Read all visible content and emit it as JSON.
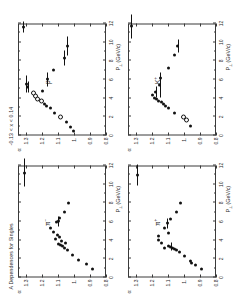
{
  "figure": {
    "title": "A Dependences for Singles",
    "kinematic_cut": "-0.13 < x  < 0.14",
    "kinematic_cut_sub": "F"
  },
  "axes": {
    "xlabel": "P  (GeV/c)",
    "xlabel_sub": "⊥",
    "ylabel": "α",
    "xticks": [
      "0",
      "2",
      "4",
      "6",
      "8",
      "10",
      "12"
    ],
    "xtick_values": [
      0,
      2,
      4,
      6,
      8,
      10,
      12
    ],
    "yticks": [
      "0.8",
      "0.9",
      "1.",
      "1.1",
      "1.2",
      "1.3"
    ],
    "ytick_values": [
      0.8,
      0.9,
      1.0,
      1.1,
      1.2,
      1.3
    ],
    "xlim": [
      0,
      12
    ],
    "ylim": [
      0.8,
      1.35
    ]
  },
  "chart_data": {
    "type": "scatter",
    "title": "A Dependences for Singles",
    "xlabel": "P⊥ (GeV/c)",
    "ylabel": "α",
    "xlim": [
      0,
      12
    ],
    "ylim": [
      0.8,
      1.35
    ],
    "grid": false,
    "legend": "none",
    "annotations": [
      "-0.13 < xF < 0.14"
    ],
    "panels": [
      {
        "id": "pi-minus",
        "label": "π",
        "label_sup": "−",
        "position": "top-left",
        "points": [
          {
            "x": 0.9,
            "y": 0.885,
            "xerr": 0.0,
            "yerr": 0.0,
            "filled": true
          },
          {
            "x": 1.4,
            "y": 0.925,
            "xerr": 0.0,
            "yerr": 0.0,
            "filled": true
          },
          {
            "x": 1.9,
            "y": 0.975,
            "xerr": 0.0,
            "yerr": 0.0,
            "filled": true
          },
          {
            "x": 2.4,
            "y": 1.012,
            "xerr": 0.0,
            "yerr": 0.0,
            "filled": true
          },
          {
            "x": 2.9,
            "y": 1.04,
            "xerr": 0.0,
            "yerr": 0.0,
            "filled": true
          },
          {
            "x": 3.2,
            "y": 1.06,
            "xerr": 0.0,
            "yerr": 0.0,
            "filled": true
          },
          {
            "x": 3.4,
            "y": 1.072,
            "xerr": 0.0,
            "yerr": 0.0,
            "filled": true
          },
          {
            "x": 3.5,
            "y": 1.085,
            "xerr": 0.0,
            "yerr": 0.0,
            "filled": true
          },
          {
            "x": 3.6,
            "y": 1.1,
            "xerr": 0.0,
            "yerr": 0.0,
            "filled": true
          },
          {
            "x": 3.7,
            "y": 1.052,
            "xerr": 0.0,
            "yerr": 0.0,
            "filled": true
          },
          {
            "x": 3.9,
            "y": 1.078,
            "xerr": 0.0,
            "yerr": 0.0,
            "filled": true
          },
          {
            "x": 4.1,
            "y": 1.118,
            "xerr": 0.0,
            "yerr": 0.0,
            "filled": true
          },
          {
            "x": 4.3,
            "y": 1.092,
            "xerr": 0.0,
            "yerr": 0.0,
            "filled": true
          },
          {
            "x": 4.6,
            "y": 1.104,
            "xerr": 0.0,
            "yerr": 0.0,
            "filled": true
          },
          {
            "x": 4.9,
            "y": 1.13,
            "xerr": 0.0,
            "yerr": 0.0,
            "filled": true
          },
          {
            "x": 5.3,
            "y": 1.145,
            "xerr": 0.0,
            "yerr": 0.0,
            "filled": true
          },
          {
            "x": 5.9,
            "y": 1.112,
            "xerr": 0.0,
            "yerr": 0.0,
            "filled": true
          },
          {
            "x": 6.0,
            "y": 1.098,
            "xerr": 0.55,
            "yerr": 0.0,
            "filled": true
          },
          {
            "x": 6.4,
            "y": 1.088,
            "xerr": 0.0,
            "yerr": 0.0,
            "filled": true
          },
          {
            "x": 7.0,
            "y": 1.06,
            "xerr": 0.0,
            "yerr": 0.0,
            "filled": true
          },
          {
            "x": 8.0,
            "y": 1.032,
            "xerr": 0.0,
            "yerr": 0.0,
            "filled": true
          },
          {
            "x": 11.2,
            "y": 1.31,
            "xerr": 1.5,
            "yerr": 0.0,
            "filled": true
          }
        ]
      },
      {
        "id": "proton",
        "label": "p",
        "label_sup": "",
        "position": "top-right",
        "points": [
          {
            "x": 0.5,
            "y": 1.002,
            "xerr": 0.0,
            "yerr": 0.0,
            "filled": true
          },
          {
            "x": 0.9,
            "y": 1.02,
            "xerr": 0.0,
            "yerr": 0.0,
            "filled": true
          },
          {
            "x": 1.4,
            "y": 1.05,
            "xerr": 0.0,
            "yerr": 0.0,
            "filled": true
          },
          {
            "x": 1.9,
            "y": 1.092,
            "xerr": 0.0,
            "yerr": 0.0,
            "filled": false
          },
          {
            "x": 2.4,
            "y": 1.12,
            "xerr": 0.0,
            "yerr": 0.0,
            "filled": true
          },
          {
            "x": 2.9,
            "y": 1.15,
            "xerr": 0.0,
            "yerr": 0.0,
            "filled": true
          },
          {
            "x": 3.2,
            "y": 1.172,
            "xerr": 0.0,
            "yerr": 0.0,
            "filled": true
          },
          {
            "x": 3.4,
            "y": 1.186,
            "xerr": 0.0,
            "yerr": 0.0,
            "filled": true
          },
          {
            "x": 3.6,
            "y": 1.21,
            "xerr": 0.0,
            "yerr": 0.0,
            "filled": false
          },
          {
            "x": 3.8,
            "y": 1.232,
            "xerr": 0.0,
            "yerr": 0.0,
            "filled": false
          },
          {
            "x": 4.1,
            "y": 1.244,
            "xerr": 0.0,
            "yerr": 0.0,
            "filled": false
          },
          {
            "x": 4.4,
            "y": 1.262,
            "xerr": 0.0,
            "yerr": 0.0,
            "filled": false
          },
          {
            "x": 4.8,
            "y": 1.196,
            "xerr": 0.0,
            "yerr": 0.0,
            "filled": true
          },
          {
            "x": 5.2,
            "y": 1.29,
            "xerr": 0.6,
            "yerr": 0.0,
            "filled": true
          },
          {
            "x": 5.5,
            "y": 1.3,
            "xerr": 0.9,
            "yerr": 0.0,
            "filled": true
          },
          {
            "x": 6.0,
            "y": 1.168,
            "xerr": 0.7,
            "yerr": 0.0,
            "filled": true
          },
          {
            "x": 7.0,
            "y": 1.128,
            "xerr": 0.0,
            "yerr": 0.0,
            "filled": true
          },
          {
            "x": 8.3,
            "y": 1.06,
            "xerr": 0.8,
            "yerr": 0.0,
            "filled": true
          },
          {
            "x": 9.6,
            "y": 1.042,
            "xerr": 1.0,
            "yerr": 0.0,
            "filled": true
          },
          {
            "x": 11.6,
            "y": 1.318,
            "xerr": 0.6,
            "yerr": 0.0,
            "filled": true
          }
        ]
      },
      {
        "id": "pi-plus",
        "label": "π",
        "label_sup": "+",
        "position": "bottom-left",
        "points": [
          {
            "x": 0.9,
            "y": 0.888,
            "xerr": 0.0,
            "yerr": 0.0,
            "filled": true
          },
          {
            "x": 1.3,
            "y": 0.93,
            "xerr": 0.0,
            "yerr": 0.0,
            "filled": true
          },
          {
            "x": 1.6,
            "y": 0.952,
            "xerr": 0.0,
            "yerr": 0.0,
            "filled": true
          },
          {
            "x": 1.8,
            "y": 0.96,
            "xerr": 0.0,
            "yerr": 0.0,
            "filled": true
          },
          {
            "x": 2.3,
            "y": 1.0,
            "xerr": 0.0,
            "yerr": 0.0,
            "filled": true
          },
          {
            "x": 2.7,
            "y": 1.03,
            "xerr": 0.0,
            "yerr": 0.0,
            "filled": true
          },
          {
            "x": 2.9,
            "y": 1.048,
            "xerr": 0.0,
            "yerr": 0.0,
            "filled": true
          },
          {
            "x": 3.1,
            "y": 1.06,
            "xerr": 0.0,
            "yerr": 0.0,
            "filled": true
          },
          {
            "x": 3.2,
            "y": 1.074,
            "xerr": 0.0,
            "yerr": 0.0,
            "filled": true
          },
          {
            "x": 3.3,
            "y": 1.084,
            "xerr": 0.45,
            "yerr": 0.0,
            "filled": true
          },
          {
            "x": 3.4,
            "y": 1.098,
            "xerr": 0.0,
            "yerr": 0.0,
            "filled": true
          },
          {
            "x": 3.2,
            "y": 1.122,
            "xerr": 0.0,
            "yerr": 0.0,
            "filled": true
          },
          {
            "x": 3.7,
            "y": 1.14,
            "xerr": 0.0,
            "yerr": 0.0,
            "filled": true
          },
          {
            "x": 4.0,
            "y": 1.158,
            "xerr": 0.0,
            "yerr": 0.0,
            "filled": true
          },
          {
            "x": 4.4,
            "y": 1.162,
            "xerr": 0.0,
            "yerr": 0.0,
            "filled": true
          },
          {
            "x": 4.8,
            "y": 1.1,
            "xerr": 0.0,
            "yerr": 0.0,
            "filled": true
          },
          {
            "x": 5.3,
            "y": 1.12,
            "xerr": 0.0,
            "yerr": 0.0,
            "filled": true
          },
          {
            "x": 5.8,
            "y": 1.106,
            "xerr": 0.55,
            "yerr": 0.0,
            "filled": true
          },
          {
            "x": 6.3,
            "y": 1.082,
            "xerr": 0.0,
            "yerr": 0.0,
            "filled": true
          },
          {
            "x": 7.0,
            "y": 1.05,
            "xerr": 0.0,
            "yerr": 0.0,
            "filled": true
          },
          {
            "x": 8.0,
            "y": 1.022,
            "xerr": 0.0,
            "yerr": 0.0,
            "filled": true
          },
          {
            "x": 11.0,
            "y": 1.292,
            "xerr": 1.1,
            "yerr": 0.0,
            "filled": true
          }
        ]
      },
      {
        "id": "k-plus",
        "label": "K",
        "label_sup": "+",
        "position": "bottom-right",
        "points": [
          {
            "x": 1.0,
            "y": 0.962,
            "xerr": 0.0,
            "yerr": 0.0,
            "filled": true
          },
          {
            "x": 1.5,
            "y": 0.988,
            "xerr": 0.0,
            "yerr": 0.0,
            "filled": false
          },
          {
            "x": 1.9,
            "y": 1.01,
            "xerr": 0.0,
            "yerr": 0.0,
            "filled": false
          },
          {
            "x": 2.4,
            "y": 1.06,
            "xerr": 0.0,
            "yerr": 0.0,
            "filled": true
          },
          {
            "x": 2.9,
            "y": 1.098,
            "xerr": 0.0,
            "yerr": 0.0,
            "filled": true
          },
          {
            "x": 3.2,
            "y": 1.118,
            "xerr": 0.0,
            "yerr": 0.0,
            "filled": true
          },
          {
            "x": 3.4,
            "y": 1.13,
            "xerr": 0.0,
            "yerr": 0.0,
            "filled": true
          },
          {
            "x": 3.6,
            "y": 1.142,
            "xerr": 0.0,
            "yerr": 0.0,
            "filled": true
          },
          {
            "x": 3.7,
            "y": 1.158,
            "xerr": 0.0,
            "yerr": 0.0,
            "filled": true
          },
          {
            "x": 3.9,
            "y": 1.17,
            "xerr": 0.0,
            "yerr": 0.0,
            "filled": true
          },
          {
            "x": 4.0,
            "y": 1.186,
            "xerr": 0.0,
            "yerr": 0.0,
            "filled": true
          },
          {
            "x": 4.3,
            "y": 1.2,
            "xerr": 0.0,
            "yerr": 0.0,
            "filled": true
          },
          {
            "x": 4.7,
            "y": 1.176,
            "xerr": 0.6,
            "yerr": 0.0,
            "filled": true
          },
          {
            "x": 5.4,
            "y": 1.152,
            "xerr": 1.3,
            "yerr": 0.0,
            "filled": true
          },
          {
            "x": 6.2,
            "y": 1.148,
            "xerr": 0.0,
            "yerr": 0.0,
            "filled": true
          },
          {
            "x": 7.2,
            "y": 1.094,
            "xerr": 0.0,
            "yerr": 0.0,
            "filled": true
          },
          {
            "x": 8.6,
            "y": 1.06,
            "xerr": 0.0,
            "yerr": 0.0,
            "filled": true
          },
          {
            "x": 9.6,
            "y": 1.04,
            "xerr": 0.7,
            "yerr": 0.0,
            "filled": true
          },
          {
            "x": 11.7,
            "y": 1.33,
            "xerr": 1.3,
            "yerr": 0.0,
            "filled": true
          }
        ]
      }
    ]
  }
}
